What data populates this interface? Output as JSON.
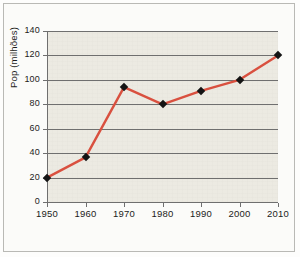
{
  "chart_data": {
    "type": "line",
    "title": "",
    "xlabel": "",
    "ylabel": "Pop (milhões)",
    "categories": [
      1950,
      1960,
      1970,
      1980,
      1990,
      2000,
      2010
    ],
    "x_tick_labels": [
      "1950",
      "1960",
      "1970",
      "1980",
      "1990",
      "2000",
      "2010"
    ],
    "values": [
      20,
      36.5,
      94,
      80,
      91,
      100,
      120
    ],
    "y_tick_labels": [
      "0",
      "20",
      "40",
      "60",
      "80",
      "100",
      "120",
      "140"
    ],
    "y_ticks": [
      0,
      20,
      40,
      60,
      80,
      100,
      120,
      140
    ],
    "xlim": [
      1950,
      2010
    ],
    "ylim": [
      0,
      140
    ],
    "grid": "horizontal",
    "legend": "none",
    "series_color": "#d9503f",
    "marker_color": "#141414",
    "marker_shape": "diamond",
    "plot_background": "#eceae2",
    "gridline_color": "#6f6f6f",
    "axis_color": "#6f6f6f",
    "frame_color": "#b9b9b5",
    "page_background": "#fbfbf9"
  }
}
